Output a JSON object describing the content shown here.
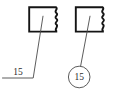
{
  "drawing": {
    "title": "Broken-out section views with item number callouts",
    "background_color": "#ffffff",
    "line_color": "#141414",
    "leader_color": "#4a4a4a",
    "text_color": "#2b2b2b",
    "views": [
      {
        "id": "left-view",
        "name": "part-view-plain-leader",
        "shape": "rectangle-with-break-line",
        "break_edge": "right",
        "callout_style": "plain-leader-with-landing-line",
        "callout_value": "15"
      },
      {
        "id": "right-view",
        "name": "part-view-balloon-leader",
        "shape": "rectangle-with-break-line",
        "break_edge": "right",
        "callout_style": "circular-balloon",
        "callout_value": "15"
      }
    ],
    "callouts": {
      "left_label": "15",
      "right_label": "15"
    }
  }
}
